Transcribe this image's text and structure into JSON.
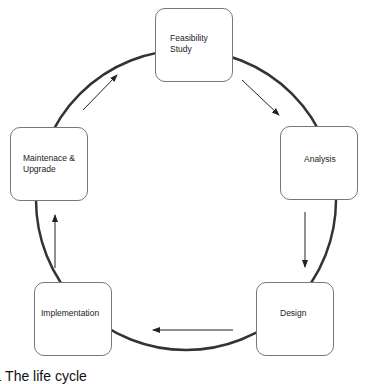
{
  "diagram": {
    "type": "cycle",
    "nodes": [
      {
        "id": "feasibility",
        "label": "Feasibility\nStudy"
      },
      {
        "id": "analysis",
        "label": "Analysis"
      },
      {
        "id": "design",
        "label": "Design"
      },
      {
        "id": "implementation",
        "label": "Implementation"
      },
      {
        "id": "maintenance",
        "label": "Maintenace &\nUpgrade"
      }
    ],
    "edges": [
      {
        "from": "feasibility",
        "to": "analysis"
      },
      {
        "from": "analysis",
        "to": "design"
      },
      {
        "from": "design",
        "to": "implementation"
      },
      {
        "from": "implementation",
        "to": "maintenance"
      },
      {
        "from": "maintenance",
        "to": "feasibility"
      }
    ],
    "caption": "7.1  The life cycle"
  },
  "colors": {
    "circle": "#333333",
    "box_border": "#777777",
    "arrow": "#222222",
    "background": "#ffffff"
  }
}
